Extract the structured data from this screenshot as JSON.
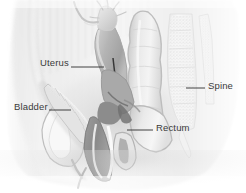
{
  "illustration": {
    "title": "Female Pelvis Sagittal Section",
    "type": "medical-anatomical-diagram",
    "view": "sagittal",
    "style": "grayscale-airbrush",
    "width": 246,
    "height": 193,
    "background_color": "#ffffff"
  },
  "labels": [
    {
      "id": "uterus",
      "text": "Uterus",
      "text_x": 40,
      "text_y": 66,
      "anchor": "start",
      "leader": {
        "x1": 71,
        "y1": 67,
        "x2": 104,
        "y2": 67
      }
    },
    {
      "id": "bladder",
      "text": "Bladder",
      "text_x": 14,
      "text_y": 110,
      "anchor": "start",
      "leader": {
        "x1": 49,
        "y1": 110,
        "x2": 71,
        "y2": 110
      }
    },
    {
      "id": "spine",
      "text": "Spine",
      "text_x": 208,
      "text_y": 89,
      "anchor": "start",
      "leader": {
        "x1": 186,
        "y1": 88,
        "x2": 205,
        "y2": 88
      }
    },
    {
      "id": "rectum",
      "text": "Rectum",
      "text_x": 156,
      "text_y": 131,
      "anchor": "start",
      "leader": {
        "x1": 127,
        "y1": 130,
        "x2": 153,
        "y2": 130
      }
    }
  ],
  "structures": [
    {
      "id": "body-outline",
      "name": "Body Silhouette",
      "fill": "#f2f2f2"
    },
    {
      "id": "abdominal-wall",
      "name": "Abdominal Wall",
      "fill": "#e8e8e8"
    },
    {
      "id": "uterus-body",
      "name": "Uterus",
      "fill": "#bdbdbd"
    },
    {
      "id": "fallopian-tube",
      "name": "Fallopian Tube and Ovary",
      "fill": "#dcdcdc"
    },
    {
      "id": "bladder-organ",
      "name": "Bladder",
      "fill": "#eeeeee"
    },
    {
      "id": "rectum-organ",
      "name": "Rectum",
      "fill": "#e4e4e4"
    },
    {
      "id": "sigmoid-colon",
      "name": "Sigmoid Colon",
      "fill": "#dedede"
    },
    {
      "id": "spine-column",
      "name": "Spine Vertebrae",
      "fill": "#f0f0f0"
    },
    {
      "id": "pubic-bone",
      "name": "Pubic Symphysis",
      "fill": "#f4f4f4"
    },
    {
      "id": "vaginal-canal",
      "name": "Vaginal Canal",
      "fill": "#9a9a9a"
    },
    {
      "id": "cervix",
      "name": "Cervix",
      "fill": "#8e8e8e"
    }
  ],
  "palette": {
    "background": "#ffffff",
    "tissue_light": "#f0f0f0",
    "tissue_mid": "#d8d8d8",
    "tissue_dark": "#b0b0b0",
    "organ_shadow": "#9a9a9a",
    "organ_deep": "#7e7e7e",
    "outline": "#a8a8a8",
    "label_color": "#3a3a3a",
    "leader_color": "#2e2e2e"
  }
}
